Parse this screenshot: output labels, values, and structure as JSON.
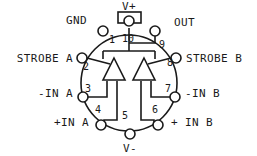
{
  "diagram": {
    "package": {
      "shape": "circle",
      "center_x": 128,
      "center_y": 83,
      "radius": 48,
      "tab_label": "V+"
    },
    "colors": {
      "line": "#1a1a1a",
      "text": "#1a1a1a",
      "background": "#ffffff"
    },
    "pins": [
      {
        "number": "1",
        "label": "GND",
        "num_x": 112,
        "num_y": 43,
        "pad_x": 103,
        "pad_y": 31,
        "label_x": 66,
        "label_y": 24,
        "label_anchor": "start"
      },
      {
        "number": "2",
        "label": "STROBE A",
        "num_x": 86,
        "num_y": 70,
        "pad_x": 82,
        "pad_y": 58,
        "label_x": 73,
        "label_y": 62,
        "label_anchor": "end"
      },
      {
        "number": "3",
        "label": "-IN A",
        "num_x": 88,
        "num_y": 92,
        "pad_x": 83,
        "pad_y": 97,
        "label_x": 73,
        "label_y": 97,
        "label_anchor": "end"
      },
      {
        "number": "4",
        "label": "+IN A",
        "num_x": 98,
        "num_y": 113,
        "pad_x": 101,
        "pad_y": 125,
        "label_x": 89,
        "label_y": 126,
        "label_anchor": "end"
      },
      {
        "number": "5",
        "label": "V-",
        "num_x": 125,
        "num_y": 119,
        "pad_x": 130,
        "pad_y": 134,
        "label_x": 130,
        "label_y": 152,
        "label_anchor": "middle"
      },
      {
        "number": "6",
        "label": "+ IN B",
        "num_x": 155,
        "num_y": 113,
        "pad_x": 158,
        "pad_y": 125,
        "label_x": 171,
        "label_y": 126,
        "label_anchor": "start"
      },
      {
        "number": "7",
        "label": "-IN B",
        "num_x": 168,
        "num_y": 92,
        "pad_x": 175,
        "pad_y": 97,
        "label_x": 185,
        "label_y": 97,
        "label_anchor": "start"
      },
      {
        "number": "8",
        "label": "STROBE B",
        "num_x": 170,
        "num_y": 66,
        "pad_x": 176,
        "pad_y": 58,
        "label_x": 186,
        "label_y": 62,
        "label_anchor": "start"
      },
      {
        "number": "9",
        "label": "OUT",
        "num_x": 162,
        "num_y": 48,
        "pad_x": 155,
        "pad_y": 31,
        "label_x": 174,
        "label_y": 26,
        "label_anchor": "start"
      },
      {
        "number": "10",
        "label": "V+",
        "num_x": 128,
        "num_y": 42,
        "pad_x": 129,
        "pad_y": 21,
        "label_x": 129,
        "label_y": 10,
        "label_anchor": "middle"
      }
    ],
    "comparators": [
      {
        "name": "comparator-a",
        "apex_x": 114,
        "apex_y": 58,
        "base_left_x": 103,
        "base_right_x": 125,
        "base_y": 80
      },
      {
        "name": "comparator-b",
        "apex_x": 144,
        "apex_y": 58,
        "base_left_x": 133,
        "base_right_x": 155,
        "base_y": 80
      }
    ]
  }
}
